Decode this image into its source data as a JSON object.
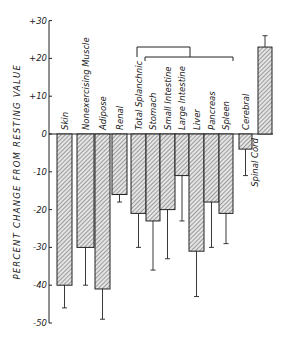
{
  "chart_data": {
    "type": "bar",
    "title": "",
    "xlabel": "",
    "ylabel": "PERCENT CHANGE FROM RESTING VALUE",
    "ylim": [
      -50,
      30
    ],
    "yticks": [
      30,
      20,
      10,
      0,
      -10,
      -20,
      -30,
      -40,
      -50
    ],
    "ytick_labels": [
      "+30",
      "+20",
      "+10",
      "0",
      "-10",
      "-20",
      "-30",
      "-40",
      "-50"
    ],
    "grid": false,
    "legend": null,
    "categories": [
      "Skin",
      "Nonexercising Muscle",
      "Adipose",
      "Renal",
      "Total Splanchnic",
      "Stomach",
      "Small Intestine",
      "Large Intestine",
      "Liver",
      "Pancreas",
      "Spleen",
      "Cerebral",
      "Spinal Cord"
    ],
    "values": [
      -40,
      -30,
      -41,
      -16,
      -21,
      -23,
      -20,
      -11,
      -31,
      -18,
      -21,
      -4,
      23
    ],
    "error_bar_ends": [
      -46,
      -40,
      -49,
      -18,
      -30,
      -36,
      -33,
      -23,
      -43,
      -30,
      -29,
      -11,
      26
    ],
    "annotations": [
      {
        "type": "bracket",
        "label": "groups Total Splanchnic with Stomach, Small Intestine, Large Intestine"
      },
      {
        "type": "bracket",
        "label": "groups splanchnic organs Stomach through Spleen"
      }
    ],
    "bar_fill": "hatched"
  },
  "colors": {
    "ink": "#222222",
    "bar_fill": "#d9d9d9",
    "hatch": "#555555",
    "background": "#ffffff"
  }
}
